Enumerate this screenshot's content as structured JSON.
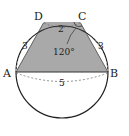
{
  "diagram": {
    "type": "cyclic-trapezoid",
    "points": {
      "A": "A",
      "B": "B",
      "C": "C",
      "D": "D"
    },
    "lengths": {
      "AD": "3",
      "DC": "2",
      "CB": "3",
      "AB": "5"
    },
    "angle": {
      "label": "120°",
      "vertex": "C"
    },
    "colors": {
      "fill": "#a8a8a8",
      "stroke": "#222222",
      "background": "#ffffff"
    }
  }
}
